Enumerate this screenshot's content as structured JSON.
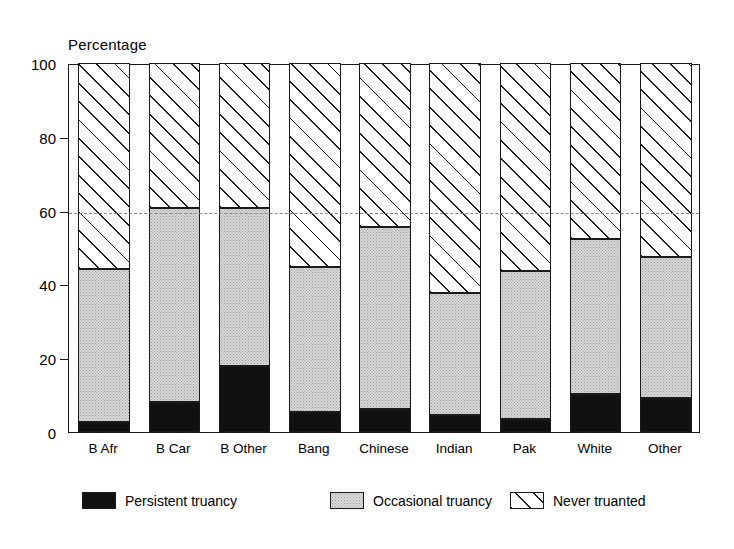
{
  "chart_data": {
    "type": "bar",
    "subtype": "stacked-bar-100",
    "title": "",
    "xlabel": "",
    "ylabel": "Percentage",
    "ylim": [
      0,
      100
    ],
    "yticks": [
      0,
      20,
      40,
      60,
      80,
      100
    ],
    "ytick_labels": [
      "0",
      "20",
      "40",
      "60",
      "80",
      "100"
    ],
    "gridlines": [
      60
    ],
    "grid": "dashed horizontal line at 60",
    "legend_position": "bottom",
    "categories": [
      "B Afr",
      "B Car",
      "B Other",
      "Bang",
      "Chinese",
      "Indian",
      "Pak",
      "White",
      "Other"
    ],
    "series": [
      {
        "name": "Persistent truancy",
        "pattern": "solid-black",
        "color": "#111111",
        "values": [
          2.7,
          8.0,
          17.8,
          5.5,
          6.3,
          4.5,
          3.5,
          10.3,
          9.3
        ]
      },
      {
        "name": "Occasional truancy",
        "pattern": "light-stipple",
        "color": "#d9d9d9",
        "values": [
          41.5,
          52.6,
          42.9,
          39.2,
          49.2,
          33.2,
          40.2,
          41.9,
          38.2
        ]
      },
      {
        "name": "Never truanted",
        "pattern": "diagonal-hatch",
        "color": "#ffffff",
        "values": [
          55.8,
          39.4,
          39.3,
          55.3,
          44.5,
          62.3,
          56.3,
          47.8,
          52.5
        ]
      }
    ],
    "cumulative_tops": {
      "persistent": [
        2.7,
        8.0,
        17.8,
        5.5,
        6.3,
        4.5,
        3.5,
        10.3,
        9.3
      ],
      "occasional": [
        44.2,
        60.6,
        60.7,
        44.7,
        55.5,
        37.7,
        43.7,
        52.2,
        47.5
      ],
      "never": [
        100,
        100,
        100,
        100,
        100,
        100,
        100,
        100,
        100
      ]
    }
  },
  "legend": {
    "items": [
      {
        "label": "Persistent truancy",
        "swatch": "solid-black-swatch"
      },
      {
        "label": "Occasional truancy",
        "swatch": "stipple-swatch"
      },
      {
        "label": "Never truanted",
        "swatch": "hatch-swatch"
      }
    ]
  }
}
